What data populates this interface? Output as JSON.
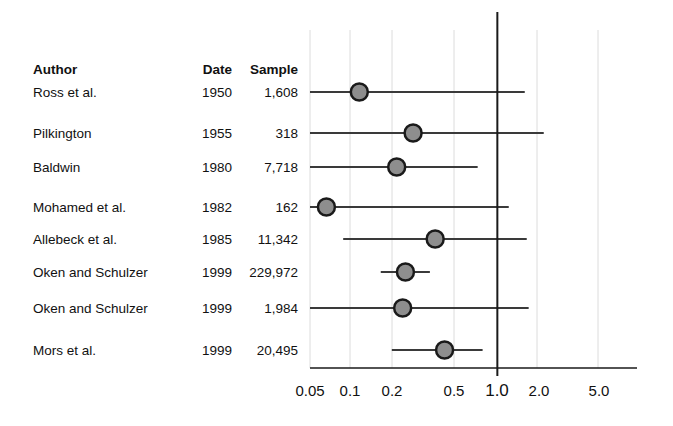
{
  "figure": {
    "type": "forest-plot",
    "columns": {
      "author": "Author",
      "date": "Date",
      "sample": "Sample"
    },
    "rows": [
      {
        "author": "Ross et al.",
        "date": "1950",
        "sample": "1,608",
        "estimate": 0.11,
        "ci_low": 0.05,
        "ci_high": 1.55
      },
      {
        "author": "Pilkington",
        "date": "1955",
        "sample": "318",
        "estimate": 0.26,
        "ci_low": 0.05,
        "ci_high": 2.1
      },
      {
        "author": "Baldwin",
        "date": "1980",
        "sample": "7,718",
        "estimate": 0.2,
        "ci_low": 0.05,
        "ci_high": 0.73
      },
      {
        "author": "Mohamed et al.",
        "date": "1982",
        "sample": "162",
        "estimate": 0.065,
        "ci_low": 0.05,
        "ci_high": 1.2
      },
      {
        "author": "Allebeck et al.",
        "date": "1985",
        "sample": "11,342",
        "estimate": 0.37,
        "ci_low": 0.085,
        "ci_high": 1.6
      },
      {
        "author": "Oken and Schulzer",
        "date": "1999",
        "sample": "229,972",
        "estimate": 0.23,
        "ci_low": 0.155,
        "ci_high": 0.34
      },
      {
        "author": "Oken and Schulzer",
        "date": "1999",
        "sample": "1,984",
        "estimate": 0.22,
        "ci_low": 0.05,
        "ci_high": 1.65
      },
      {
        "author": "Mors et al.",
        "date": "1999",
        "sample": "20,495",
        "estimate": 0.43,
        "ci_low": 0.185,
        "ci_high": 0.79
      }
    ]
  },
  "chart_data": {
    "type": "scatter",
    "title": "",
    "xlabel": "",
    "ylabel": "",
    "scale": "log",
    "xlim": [
      0.05,
      5.0
    ],
    "grid": true,
    "legend": "none",
    "reference_line": 1.0,
    "xticks": [
      "0.05",
      "0.1",
      "0.2",
      "0.5",
      "1.0",
      "2.0",
      "5.0"
    ],
    "xtick_values": [
      0.05,
      0.1,
      0.2,
      0.5,
      1.0,
      2.0,
      5.0
    ],
    "categories": [
      "Ross et al. 1950",
      "Pilkington 1955",
      "Baldwin 1980",
      "Mohamed et al. 1982",
      "Allebeck et al. 1985",
      "Oken and Schulzer 1999 (229,972)",
      "Oken and Schulzer 1999 (1,984)",
      "Mors et al. 1999"
    ],
    "values": [
      0.11,
      0.26,
      0.2,
      0.065,
      0.37,
      0.23,
      0.22,
      0.43
    ],
    "ci_low": [
      0.05,
      0.05,
      0.05,
      0.05,
      0.085,
      0.155,
      0.05,
      0.185
    ],
    "ci_high": [
      1.55,
      2.1,
      0.73,
      1.2,
      1.6,
      0.34,
      1.65,
      0.79
    ],
    "sample_sizes": [
      1608,
      318,
      7718,
      162,
      11342,
      229972,
      1984,
      20495
    ]
  },
  "style": {
    "marker_fill": "#8e8e8e",
    "marker_edge": "#1a1a1a",
    "line_color": "#3a3a3a",
    "grid_color": "#dcdcdc",
    "axis_color": "#1a1a1a",
    "text_color": "#111111",
    "background": "#ffffff"
  },
  "geometry": {
    "tick_x": [
      310,
      350,
      392,
      454,
      496,
      537,
      598
    ],
    "row_y": [
      92,
      133,
      167,
      207,
      239,
      272,
      308,
      350
    ],
    "header_y": 70,
    "axis_y": 368,
    "axis_x_start": 310,
    "axis_x_end": 637,
    "grid_top": 30,
    "label_y": 382
  }
}
